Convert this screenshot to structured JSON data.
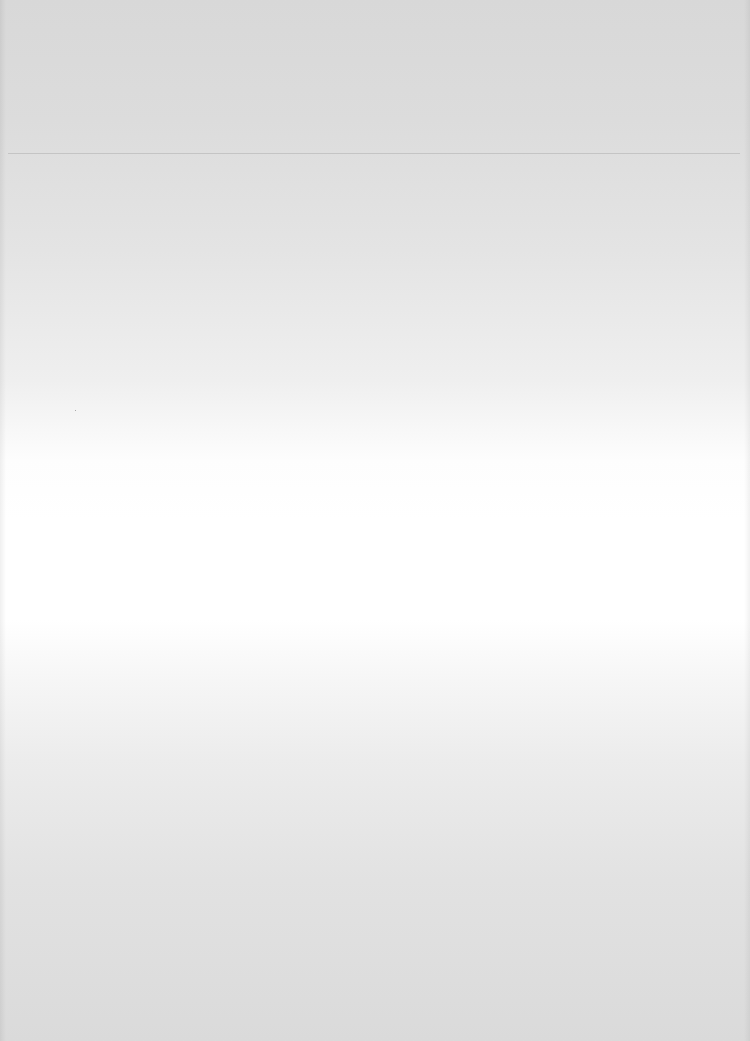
{
  "document": {
    "type": "scanned-page",
    "content": "",
    "colors": {
      "top_tone": "#d8d8d8",
      "center_tone": "#ffffff",
      "bottom_tone": "#dadada",
      "scan_line": "#969696"
    }
  }
}
